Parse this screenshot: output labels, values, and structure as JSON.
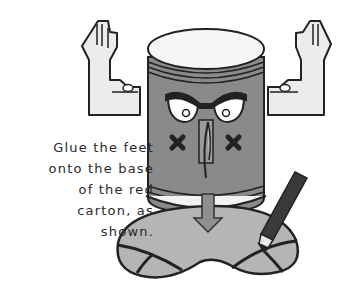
{
  "caption": {
    "lines": [
      "Glue the feet",
      "onto the base",
      "of the red",
      "carton, as",
      "shown."
    ]
  },
  "illustration": {
    "subject": "robot-craft-can",
    "parts": [
      "left-arm-hand",
      "right-arm-hand",
      "can-lid",
      "can-body",
      "angry-eyes",
      "nose-tab",
      "x-cheeks",
      "down-arrow",
      "feet-base",
      "marker-pen"
    ]
  },
  "colors": {
    "outline": "#222222",
    "lid": "#f4f4f4",
    "can_body": "#8a8a8a",
    "arms": "#ececec",
    "feet": "#b5b5b5",
    "arrow": "#8f8f8f",
    "pen": "#3a3a3a",
    "text": "#2a2a2a"
  }
}
